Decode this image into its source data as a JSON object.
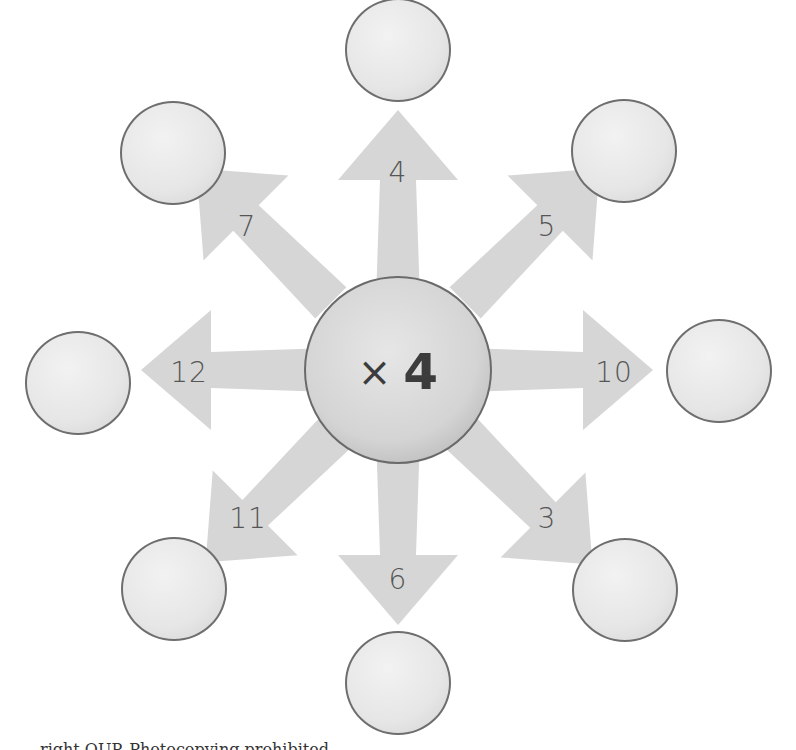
{
  "center": {
    "operator": "×",
    "operand": "4"
  },
  "arrows": [
    {
      "direction": "up",
      "number": "4"
    },
    {
      "direction": "up-right",
      "number": "5"
    },
    {
      "direction": "right",
      "number": "10"
    },
    {
      "direction": "down-right",
      "number": "3"
    },
    {
      "direction": "down",
      "number": "6"
    },
    {
      "direction": "down-left",
      "number": "11"
    },
    {
      "direction": "left",
      "number": "12"
    },
    {
      "direction": "up-left",
      "number": "7"
    }
  ],
  "answer_circles": [
    "",
    "",
    "",
    "",
    "",
    "",
    "",
    ""
  ],
  "colors": {
    "arrow_fill": "#d6d6d6",
    "circle_border": "#6e6e6e",
    "text": "#555555"
  },
  "caption": "right OUP. Photocopying prohibited"
}
